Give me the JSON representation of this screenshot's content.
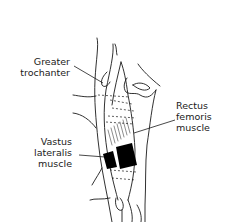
{
  "diagram": {
    "labels": {
      "greater_trochanter": [
        "Greater",
        "trochanter"
      ],
      "rectus_femoris": [
        "Rectus",
        "femoris",
        "muscle"
      ],
      "vastus_lateralis": [
        "Vastus",
        "lateralis",
        "muscle"
      ]
    },
    "colors": {
      "line": "#1a1a1a",
      "electrode": "#000000",
      "background": "#ffffff"
    },
    "electrodes": [
      {
        "name": "vastus-lateralis-electrode",
        "x": 103,
        "y": 153,
        "w": 14,
        "h": 16
      },
      {
        "name": "rectus-femoris-electrode",
        "x": 116,
        "y": 145,
        "w": 20,
        "h": 23
      }
    ]
  }
}
